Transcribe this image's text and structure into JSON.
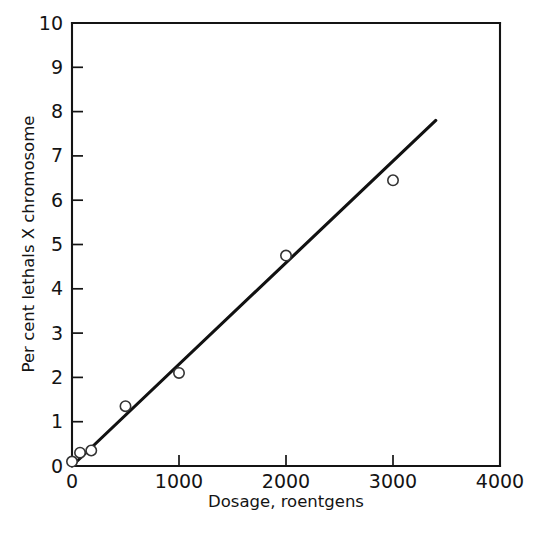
{
  "chart_data": {
    "type": "scatter",
    "title": "",
    "xlabel": "Dosage, roentgens",
    "ylabel": "Per cent lethals X chromosome",
    "xlim": [
      0,
      4000
    ],
    "ylim": [
      0,
      10
    ],
    "xticks": [
      0,
      1000,
      2000,
      3000,
      4000
    ],
    "yticks": [
      0,
      1,
      2,
      3,
      4,
      5,
      6,
      7,
      8,
      9,
      10
    ],
    "xtick_labels": [
      "0",
      "1000",
      "2000",
      "3000",
      "4000"
    ],
    "ytick_labels": [
      "0",
      "1",
      "2",
      "3",
      "4",
      "5",
      "6",
      "7",
      "8",
      "9",
      "10"
    ],
    "grid": false,
    "legend": null,
    "marker": "open-circle",
    "points": [
      {
        "x": 0,
        "y": 0.1
      },
      {
        "x": 75,
        "y": 0.3
      },
      {
        "x": 180,
        "y": 0.35
      },
      {
        "x": 500,
        "y": 1.35
      },
      {
        "x": 1000,
        "y": 2.1
      },
      {
        "x": 2000,
        "y": 4.75
      },
      {
        "x": 3000,
        "y": 6.45
      }
    ],
    "fit_line": {
      "type": "line",
      "name": "linear fit",
      "x": [
        0,
        3400
      ],
      "y": [
        0.0,
        7.8
      ]
    }
  },
  "axes": {
    "x_title": "Dosage, roentgens",
    "y_title": "Per cent lethals X chromosome"
  },
  "colors": {
    "axis": "#141414",
    "line": "#111111",
    "marker_stroke": "#333333",
    "marker_fill": "#ffffff",
    "background": "#ffffff"
  }
}
